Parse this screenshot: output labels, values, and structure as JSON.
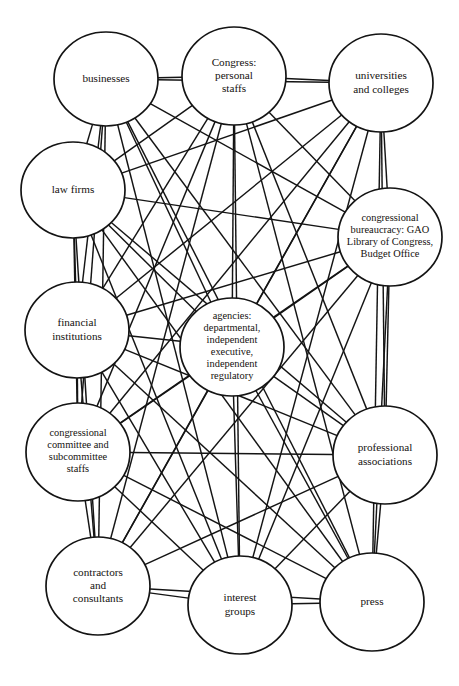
{
  "diagram": {
    "type": "network-graph",
    "canvas": {
      "width": 459,
      "height": 686
    },
    "style": {
      "background_color": "#ffffff",
      "node_fill": "#ffffff",
      "node_stroke": "#141414",
      "edge_stroke": "#141414",
      "label_color": "#15120f"
    },
    "nodes": [
      {
        "id": "businesses",
        "label": "businesses",
        "lines": [
          "businesses"
        ],
        "cx": 106,
        "cy": 79,
        "rx": 52,
        "ry": 47,
        "font_size": 11.2
      },
      {
        "id": "congress-personal-staffs",
        "label": "Congress: personal staffs",
        "lines": [
          "Congress:",
          "personal",
          "staffs"
        ],
        "cx": 234,
        "cy": 76,
        "rx": 52,
        "ry": 49,
        "font_size": 11.2
      },
      {
        "id": "universities-and-colleges",
        "label": "universities and colleges",
        "lines": [
          "universities",
          "and colleges"
        ],
        "cx": 381,
        "cy": 83,
        "rx": 52,
        "ry": 49,
        "font_size": 11.2
      },
      {
        "id": "law-firms",
        "label": "law firms",
        "lines": [
          "law firms"
        ],
        "cx": 73,
        "cy": 190,
        "rx": 52,
        "ry": 48,
        "font_size": 11.2
      },
      {
        "id": "congressional-bureaucracy",
        "label": "congressional bureaucracy: GAO Library of Congress, Budget Office",
        "lines": [
          "congressional",
          "bureaucracy: GAO",
          "Library of Congress,",
          "Budget Office"
        ],
        "cx": 390,
        "cy": 237,
        "rx": 52,
        "ry": 49,
        "font_size": 10.4
      },
      {
        "id": "financial-institutions",
        "label": "financial institutions",
        "lines": [
          "financial",
          "institutions"
        ],
        "cx": 77,
        "cy": 330,
        "rx": 52,
        "ry": 48,
        "font_size": 11.2
      },
      {
        "id": "agencies",
        "label": "agencies: departmental, independent executive, independent regulatory",
        "lines": [
          "agencies:",
          "departmental,",
          "independent",
          "executive,",
          "independent",
          "regulatory"
        ],
        "cx": 232,
        "cy": 347,
        "rx": 52,
        "ry": 49,
        "font_size": 10.4
      },
      {
        "id": "congressional-committee-staffs",
        "label": "congressional committee and subcommittee staffs",
        "lines": [
          "congressional",
          "committee and",
          "subcommittee",
          "staffs"
        ],
        "cx": 78,
        "cy": 452,
        "rx": 52,
        "ry": 49,
        "font_size": 10.4
      },
      {
        "id": "professional-associations",
        "label": "professional associations",
        "lines": [
          "professional",
          "associations"
        ],
        "cx": 385,
        "cy": 455,
        "rx": 52,
        "ry": 49,
        "font_size": 11.2
      },
      {
        "id": "contractors-and-consultants",
        "label": "contractors and consultants",
        "lines": [
          "contractors",
          "and",
          "consultants"
        ],
        "cx": 98,
        "cy": 586,
        "rx": 52,
        "ry": 49,
        "font_size": 11.2
      },
      {
        "id": "interest-groups",
        "label": "interest groups",
        "lines": [
          "interest",
          "groups"
        ],
        "cx": 240,
        "cy": 605,
        "rx": 52,
        "ry": 49,
        "font_size": 11.2
      },
      {
        "id": "press",
        "label": "press",
        "lines": [
          "press"
        ],
        "cx": 372,
        "cy": 602,
        "rx": 52,
        "ry": 49,
        "font_size": 11.2
      }
    ],
    "edges": [
      [
        "businesses",
        "congress-personal-staffs"
      ],
      [
        "businesses",
        "universities-and-colleges"
      ],
      [
        "businesses",
        "law-firms"
      ],
      [
        "businesses",
        "congressional-bureaucracy"
      ],
      [
        "businesses",
        "financial-institutions"
      ],
      [
        "businesses",
        "agencies"
      ],
      [
        "businesses",
        "congressional-committee-staffs"
      ],
      [
        "businesses",
        "professional-associations"
      ],
      [
        "businesses",
        "contractors-and-consultants"
      ],
      [
        "businesses",
        "interest-groups"
      ],
      [
        "businesses",
        "press"
      ],
      [
        "congress-personal-staffs",
        "universities-and-colleges"
      ],
      [
        "congress-personal-staffs",
        "law-firms"
      ],
      [
        "congress-personal-staffs",
        "congressional-bureaucracy"
      ],
      [
        "congress-personal-staffs",
        "financial-institutions"
      ],
      [
        "congress-personal-staffs",
        "agencies"
      ],
      [
        "congress-personal-staffs",
        "congressional-committee-staffs"
      ],
      [
        "congress-personal-staffs",
        "professional-associations"
      ],
      [
        "congress-personal-staffs",
        "contractors-and-consultants"
      ],
      [
        "congress-personal-staffs",
        "interest-groups"
      ],
      [
        "congress-personal-staffs",
        "press"
      ],
      [
        "universities-and-colleges",
        "law-firms"
      ],
      [
        "universities-and-colleges",
        "congressional-bureaucracy"
      ],
      [
        "universities-and-colleges",
        "financial-institutions"
      ],
      [
        "universities-and-colleges",
        "agencies"
      ],
      [
        "universities-and-colleges",
        "congressional-committee-staffs"
      ],
      [
        "universities-and-colleges",
        "professional-associations"
      ],
      [
        "universities-and-colleges",
        "contractors-and-consultants"
      ],
      [
        "universities-and-colleges",
        "interest-groups"
      ],
      [
        "universities-and-colleges",
        "press"
      ],
      [
        "law-firms",
        "congressional-bureaucracy"
      ],
      [
        "law-firms",
        "financial-institutions"
      ],
      [
        "law-firms",
        "agencies"
      ],
      [
        "law-firms",
        "congressional-committee-staffs"
      ],
      [
        "law-firms",
        "professional-associations"
      ],
      [
        "law-firms",
        "contractors-and-consultants"
      ],
      [
        "law-firms",
        "interest-groups"
      ],
      [
        "law-firms",
        "press"
      ],
      [
        "congressional-bureaucracy",
        "financial-institutions"
      ],
      [
        "congressional-bureaucracy",
        "agencies"
      ],
      [
        "congressional-bureaucracy",
        "congressional-committee-staffs"
      ],
      [
        "congressional-bureaucracy",
        "professional-associations"
      ],
      [
        "congressional-bureaucracy",
        "contractors-and-consultants"
      ],
      [
        "congressional-bureaucracy",
        "interest-groups"
      ],
      [
        "congressional-bureaucracy",
        "press"
      ],
      [
        "financial-institutions",
        "agencies"
      ],
      [
        "financial-institutions",
        "congressional-committee-staffs"
      ],
      [
        "financial-institutions",
        "professional-associations"
      ],
      [
        "financial-institutions",
        "contractors-and-consultants"
      ],
      [
        "financial-institutions",
        "interest-groups"
      ],
      [
        "financial-institutions",
        "press"
      ],
      [
        "agencies",
        "congressional-committee-staffs"
      ],
      [
        "agencies",
        "professional-associations"
      ],
      [
        "agencies",
        "contractors-and-consultants"
      ],
      [
        "agencies",
        "interest-groups"
      ],
      [
        "agencies",
        "press"
      ],
      [
        "congressional-committee-staffs",
        "professional-associations"
      ],
      [
        "congressional-committee-staffs",
        "contractors-and-consultants"
      ],
      [
        "congressional-committee-staffs",
        "interest-groups"
      ],
      [
        "congressional-committee-staffs",
        "press"
      ],
      [
        "professional-associations",
        "contractors-and-consultants"
      ],
      [
        "professional-associations",
        "interest-groups"
      ],
      [
        "professional-associations",
        "press"
      ],
      [
        "contractors-and-consultants",
        "interest-groups"
      ],
      [
        "contractors-and-consultants",
        "press"
      ],
      [
        "interest-groups",
        "press"
      ]
    ]
  }
}
